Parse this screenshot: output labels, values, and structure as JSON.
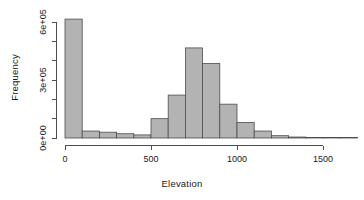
{
  "chart_data": {
    "type": "bar",
    "subtype": "histogram",
    "title": "",
    "xlabel": "Elevation",
    "ylabel": "Frequency",
    "xlim": [
      0,
      1700
    ],
    "ylim": [
      0,
      640000
    ],
    "grid": false,
    "legend": null,
    "bin_width": 100,
    "bar_fill": "#b3b3b3",
    "bar_stroke": "#4d4d4d",
    "axis_color": "#4d4d4d",
    "text_color": "#1a1a1a",
    "background": "#ffffff",
    "x_ticks": [
      0,
      500,
      1000,
      1500
    ],
    "x_tick_labels": [
      "0",
      "500",
      "1000",
      "1500"
    ],
    "y_ticks": [
      0,
      300000,
      600000
    ],
    "y_tick_labels": [
      "0e+00",
      "3e+05",
      "6e+05"
    ],
    "y_minor_ticks": [
      100000,
      200000,
      400000,
      500000
    ],
    "bin_starts": [
      0,
      100,
      200,
      300,
      400,
      500,
      600,
      700,
      800,
      900,
      1000,
      1100,
      1200,
      1300,
      1400,
      1500,
      1600
    ],
    "bin_ends": [
      100,
      200,
      300,
      400,
      500,
      600,
      700,
      800,
      900,
      1000,
      1100,
      1200,
      1300,
      1400,
      1500,
      1600,
      1700
    ],
    "categories": [
      "0-100",
      "100-200",
      "200-300",
      "300-400",
      "400-500",
      "500-600",
      "600-700",
      "700-800",
      "800-900",
      "900-1000",
      "1000-1100",
      "1100-1200",
      "1200-1300",
      "1300-1400",
      "1400-1500",
      "1500-1600",
      "1600-1700"
    ],
    "values": [
      615000,
      36000,
      30000,
      22000,
      16000,
      100000,
      222000,
      466000,
      385000,
      175000,
      80000,
      36000,
      12000,
      5000,
      2000,
      1000,
      500
    ]
  },
  "labels": {
    "xlabel": "Elevation",
    "ylabel": "Frequency"
  }
}
